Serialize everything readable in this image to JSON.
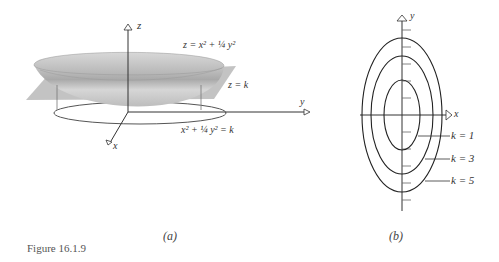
{
  "figure": {
    "caption": "Figure 16.1.9",
    "panel_a": {
      "label": "(a)",
      "axis_z": "z",
      "axis_y": "y",
      "axis_x": "x",
      "surface_eq": "z = x² + ¼ y²",
      "plane_eq": "z = k",
      "level_curve_eq": "x² + ¼ y² = k"
    },
    "panel_b": {
      "label": "(b)",
      "axis_y": "y",
      "axis_x": "x",
      "level_curves": [
        {
          "label": "k = 1",
          "k": 1
        },
        {
          "label": "k = 3",
          "k": 3
        },
        {
          "label": "k = 5",
          "k": 5
        }
      ]
    }
  },
  "colors": {
    "line": "#333333",
    "bowl_light": "#d9d9d9",
    "bowl_dark": "#a8a8a8",
    "plane": "#b8b8b8"
  }
}
